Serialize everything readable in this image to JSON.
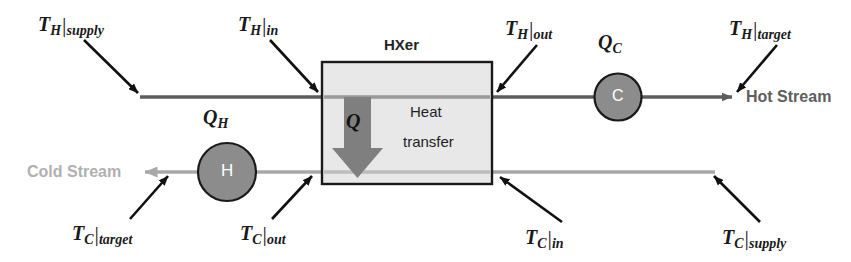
{
  "diagram": {
    "hxer_label": "HXer",
    "box_text_line1": "Heat",
    "box_text_line2": "transfer",
    "q_arrow_label": "Q",
    "hot_stream_label": "Hot Stream",
    "cold_stream_label": "Cold Stream"
  },
  "units": {
    "heater": {
      "letter": "H",
      "duty_symbol": "Q",
      "duty_subscript": "H"
    },
    "cooler": {
      "letter": "C",
      "duty_symbol": "Q",
      "duty_subscript": "C"
    }
  },
  "temperature_labels": {
    "th_supply": {
      "symbol": "T",
      "stream": "H",
      "bar": "|",
      "qualifier": "supply"
    },
    "th_in": {
      "symbol": "T",
      "stream": "H",
      "bar": "|",
      "qualifier": "in"
    },
    "th_out": {
      "symbol": "T",
      "stream": "H",
      "bar": "|",
      "qualifier": "out"
    },
    "th_target": {
      "symbol": "T",
      "stream": "H",
      "bar": "|",
      "qualifier": "target"
    },
    "tc_target": {
      "symbol": "T",
      "stream": "C",
      "bar": "|",
      "qualifier": "target"
    },
    "tc_out": {
      "symbol": "T",
      "stream": "C",
      "bar": "|",
      "qualifier": "out"
    },
    "tc_in": {
      "symbol": "T",
      "stream": "C",
      "bar": "|",
      "qualifier": "in"
    },
    "tc_supply": {
      "symbol": "T",
      "stream": "C",
      "bar": "|",
      "qualifier": "supply"
    }
  },
  "colors": {
    "hot_line": "#5e5e5e",
    "cold_line": "#a8a8a8",
    "box_fill": "#e8e8e8",
    "box_stroke": "#1a1a1a",
    "circle_fill": "#8c8c8c",
    "circle_stroke": "#1a1a1a",
    "q_arrow_fill": "#7f7f7f",
    "pointer_arrow": "#111111",
    "background": "#ffffff"
  }
}
